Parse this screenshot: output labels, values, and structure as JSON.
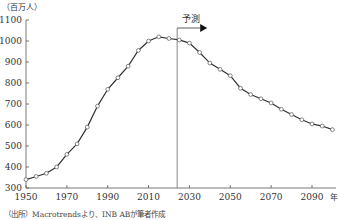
{
  "chart_data": {
    "type": "line",
    "title": "",
    "ylabel": "（百万人）",
    "xlabel": "年",
    "ylim": [
      300,
      1100
    ],
    "xlim": [
      1950,
      2100
    ],
    "yticks": [
      300,
      400,
      500,
      600,
      700,
      800,
      900,
      1000,
      1100
    ],
    "xticks": [
      1950,
      1970,
      1990,
      2010,
      2030,
      2050,
      2070,
      2090
    ],
    "grid": false,
    "annotation": {
      "label": "予測",
      "x": 2024,
      "arrow": "right"
    },
    "source": "（出所）Macrotrendsより、INB ABが筆者作成",
    "series": [
      {
        "name": "population",
        "x": [
          1950,
          1955,
          1960,
          1965,
          1970,
          1975,
          1980,
          1985,
          1990,
          1995,
          2000,
          2005,
          2010,
          2015,
          2020,
          2025,
          2030,
          2035,
          2040,
          2045,
          2050,
          2055,
          2060,
          2065,
          2070,
          2075,
          2080,
          2085,
          2090,
          2095,
          2100
        ],
        "values": [
          340,
          355,
          370,
          400,
          460,
          510,
          590,
          690,
          770,
          825,
          880,
          955,
          1000,
          1020,
          1012,
          1005,
          990,
          945,
          895,
          865,
          835,
          775,
          745,
          725,
          705,
          675,
          650,
          625,
          605,
          595,
          578
        ]
      }
    ]
  }
}
